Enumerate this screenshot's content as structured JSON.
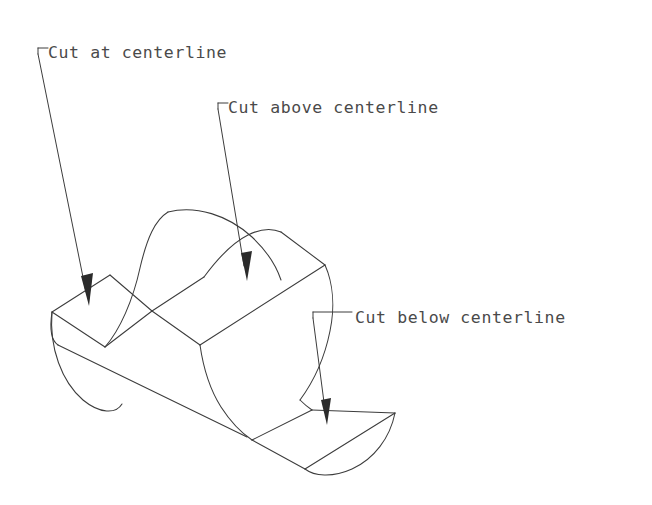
{
  "drawing": {
    "title": "Isometric cylinder with three milled flats",
    "background_color": "#ffffff",
    "line_color": "#3c3c3c",
    "text_color": "#4a4a4a",
    "width": 652,
    "height": 505,
    "annotations": [
      {
        "id": "cut-at-centerline",
        "text": "Cut at centerline",
        "text_x": 48,
        "text_y": 58,
        "hook_x": 38,
        "hook_y": 48,
        "arrow_tip_x": 89,
        "arrow_tip_y": 306
      },
      {
        "id": "cut-above-centerline",
        "text": "Cut above centerline",
        "text_x": 228,
        "text_y": 113,
        "hook_x": 218,
        "hook_y": 103,
        "arrow_tip_x": 247,
        "arrow_tip_y": 281
      },
      {
        "id": "cut-below-centerline",
        "text": "Cut below centerline",
        "text_x": 355,
        "text_y": 323,
        "hook_x": 313,
        "hook_y": 312,
        "arrow_tip_x": 327,
        "arrow_tip_y": 425
      }
    ],
    "features": [
      {
        "name": "left-flat-at-centerline",
        "label": "Cut at centerline"
      },
      {
        "name": "middle-flat-above-centerline",
        "label": "Cut above centerline"
      },
      {
        "name": "right-flat-below-centerline",
        "label": "Cut below centerline"
      }
    ]
  }
}
